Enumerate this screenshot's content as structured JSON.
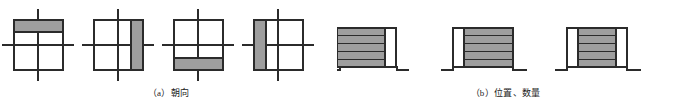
{
  "figure": {
    "background_color": "#ffffff",
    "stroke_color": "#2b2b2b",
    "fill_gray": "#9e9e9e",
    "fill_white": "#ffffff"
  },
  "panels": [
    {
      "id": "a",
      "caption": "（a）朝向",
      "caption_label": "(a)",
      "caption_text": "朝向",
      "type": "plan-orientation-diagrams",
      "diagrams": [
        {
          "name": "orientation-north",
          "bar_side": "top",
          "bar_orientation": "horizontal",
          "description": "bar along top edge"
        },
        {
          "name": "orientation-east",
          "bar_side": "right",
          "bar_orientation": "vertical",
          "description": "bar along right edge"
        },
        {
          "name": "orientation-south",
          "bar_side": "bottom",
          "bar_orientation": "horizontal",
          "description": "bar along bottom edge"
        },
        {
          "name": "orientation-west",
          "bar_side": "left",
          "bar_orientation": "vertical",
          "description": "bar along left edge"
        }
      ]
    },
    {
      "id": "b",
      "caption": "（b）位置、数量",
      "caption_label": "(b)",
      "caption_text": "位置、数量",
      "type": "elevation-position-count-diagrams",
      "diagrams": [
        {
          "name": "position-left-aligned",
          "gap_side": "right",
          "bands": 5,
          "description": "massing pushed to left, void strip on right"
        },
        {
          "name": "position-right-aligned",
          "gap_side": "left",
          "bands": 5,
          "description": "massing pushed to right, void strip on left"
        },
        {
          "name": "position-centered",
          "gap_side": "both",
          "bands": 5,
          "description": "massing centered, void strips both sides"
        }
      ]
    }
  ]
}
